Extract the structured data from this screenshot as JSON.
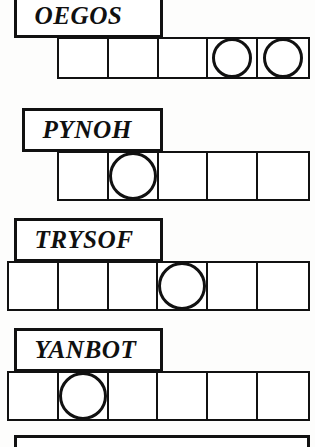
{
  "page": {
    "width": 315,
    "height": 447,
    "ink_color": "#111111",
    "paper_color": "#ffffff"
  },
  "puzzles": [
    {
      "word": "OEGOS",
      "label_box": {
        "x": 14,
        "y": -6,
        "width": 149,
        "height": 44
      },
      "grid": {
        "x": 57,
        "y": 37,
        "width": 253,
        "height": 42,
        "cells": 5,
        "circles": [
          3,
          4
        ]
      }
    },
    {
      "word": "PYNOH",
      "label_box": {
        "x": 22,
        "y": 108,
        "width": 141,
        "height": 44
      },
      "grid": {
        "x": 57,
        "y": 151,
        "width": 253,
        "height": 50,
        "cells": 5,
        "circles": [
          1
        ]
      }
    },
    {
      "word": "TRYSOF",
      "label_box": {
        "x": 14,
        "y": 218,
        "width": 149,
        "height": 44
      },
      "grid": {
        "x": 7,
        "y": 261,
        "width": 303,
        "height": 50,
        "cells": 6,
        "circles": [
          3
        ]
      }
    },
    {
      "word": "YANBOT",
      "label_box": {
        "x": 14,
        "y": 328,
        "width": 149,
        "height": 44
      },
      "grid": {
        "x": 7,
        "y": 371,
        "width": 303,
        "height": 50,
        "cells": 6,
        "circles": [
          1
        ]
      }
    }
  ],
  "partial_bottom_box": {
    "x": 14,
    "y": 435,
    "width": 296,
    "height": 12
  }
}
